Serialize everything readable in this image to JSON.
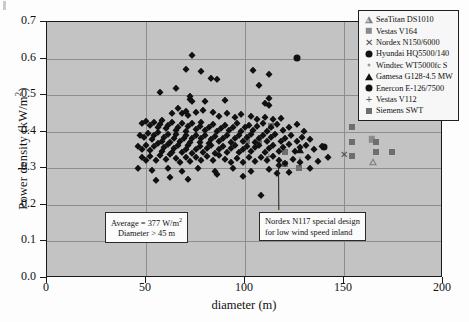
{
  "chart_data": {
    "type": "scatter",
    "title": "",
    "xlabel": "diameter (m)",
    "ylabel": "Power density (kW/m²)",
    "xlim": [
      0,
      200
    ],
    "ylim": [
      0.0,
      0.7
    ],
    "xticks": [
      0,
      50,
      100,
      150,
      200
    ],
    "yticks": [
      "0.0",
      "0.1",
      "0.2",
      "0.3",
      "0.4",
      "0.5",
      "0.6",
      "0.7"
    ],
    "grid": true,
    "legend_position": "top-right",
    "background_color": "#c3c3c3",
    "series": [
      {
        "name": "SeaTitan DS1010",
        "marker": "triangle-open",
        "color": "#7d7d7d",
        "points": [
          [
            165,
            0.318
          ]
        ]
      },
      {
        "name": "Vestas V164",
        "marker": "square-gray",
        "color": "#8a8a8a",
        "points": [
          [
            164,
            0.379
          ]
        ]
      },
      {
        "name": "Nordex N150/6000",
        "marker": "x",
        "color": "#4a4a4a",
        "points": [
          [
            150,
            0.34
          ]
        ]
      },
      {
        "name": "Hyundai HQ5500/140",
        "marker": "circle",
        "color": "#111111",
        "points": [
          [
            140,
            0.357
          ]
        ]
      },
      {
        "name": "Windtec WT5000fc S",
        "marker": "dot",
        "color": "#9b9b9b",
        "points": [
          [
            128,
            0.329
          ]
        ]
      },
      {
        "name": "Gamesa G128-4.5 MW",
        "marker": "triangle",
        "color": "#111111",
        "points": [
          [
            128,
            0.35
          ]
        ]
      },
      {
        "name": "Enercon E-126/7500",
        "marker": "circle",
        "color": "#111111",
        "points": [
          [
            126,
            0.601
          ]
        ]
      },
      {
        "name": "Vestas V112",
        "marker": "plus",
        "color": "#5a5a5a",
        "points": [
          [
            112,
            0.335
          ]
        ]
      },
      {
        "name": "Siemens SWT",
        "marker": "square-dark",
        "color": "#6e6e6e",
        "points": [
          [
            101,
            0.374
          ],
          [
            107,
            0.374
          ],
          [
            113,
            0.416
          ],
          [
            120,
            0.312
          ],
          [
            120,
            0.345
          ],
          [
            127,
            0.3
          ],
          [
            154,
            0.413
          ],
          [
            154,
            0.373
          ],
          [
            154,
            0.335
          ],
          [
            166,
            0.373
          ],
          [
            166,
            0.345
          ],
          [
            174,
            0.345
          ]
        ]
      },
      {
        "name": "Wind turbine fleet",
        "marker": "diamond",
        "color": "#111111",
        "points": [
          [
            73,
            0.611
          ],
          [
            70,
            0.572
          ],
          [
            78,
            0.567
          ],
          [
            65,
            0.52
          ],
          [
            83,
            0.546
          ],
          [
            86,
            0.544
          ],
          [
            104,
            0.568
          ],
          [
            112,
            0.558
          ],
          [
            107,
            0.529
          ],
          [
            57,
            0.509
          ],
          [
            72,
            0.497
          ],
          [
            72,
            0.49
          ],
          [
            73,
            0.484
          ],
          [
            80,
            0.484
          ],
          [
            90,
            0.487
          ],
          [
            112,
            0.493
          ],
          [
            112,
            0.473
          ],
          [
            110,
            0.479
          ],
          [
            63,
            0.452
          ],
          [
            66,
            0.466
          ],
          [
            68,
            0.452
          ],
          [
            70,
            0.458
          ],
          [
            71,
            0.446
          ],
          [
            75,
            0.455
          ],
          [
            79,
            0.46
          ],
          [
            84,
            0.454
          ],
          [
            87,
            0.443
          ],
          [
            91,
            0.45
          ],
          [
            95,
            0.441
          ],
          [
            98,
            0.448
          ],
          [
            103,
            0.444
          ],
          [
            106,
            0.436
          ],
          [
            110,
            0.44
          ],
          [
            114,
            0.434
          ],
          [
            118,
            0.438
          ],
          [
            48,
            0.424
          ],
          [
            50,
            0.43
          ],
          [
            52,
            0.418
          ],
          [
            54,
            0.428
          ],
          [
            56,
            0.414
          ],
          [
            57,
            0.422
          ],
          [
            58,
            0.432
          ],
          [
            60,
            0.41
          ],
          [
            61,
            0.419
          ],
          [
            63,
            0.426
          ],
          [
            65,
            0.404
          ],
          [
            66,
            0.413
          ],
          [
            68,
            0.423
          ],
          [
            70,
            0.402
          ],
          [
            71,
            0.415
          ],
          [
            73,
            0.425
          ],
          [
            75,
            0.408
          ],
          [
            77,
            0.417
          ],
          [
            78,
            0.427
          ],
          [
            80,
            0.406
          ],
          [
            82,
            0.413
          ],
          [
            84,
            0.421
          ],
          [
            86,
            0.401
          ],
          [
            88,
            0.411
          ],
          [
            90,
            0.418
          ],
          [
            92,
            0.405
          ],
          [
            94,
            0.414
          ],
          [
            96,
            0.423
          ],
          [
            98,
            0.402
          ],
          [
            100,
            0.412
          ],
          [
            102,
            0.419
          ],
          [
            104,
            0.406
          ],
          [
            106,
            0.415
          ],
          [
            109,
            0.424
          ],
          [
            111,
            0.403
          ],
          [
            113,
            0.412
          ],
          [
            116,
            0.421
          ],
          [
            119,
            0.404
          ],
          [
            122,
            0.414
          ],
          [
            126,
            0.42
          ],
          [
            130,
            0.402
          ],
          [
            47,
            0.392
          ],
          [
            49,
            0.386
          ],
          [
            51,
            0.396
          ],
          [
            53,
            0.38
          ],
          [
            54,
            0.39
          ],
          [
            56,
            0.398
          ],
          [
            58,
            0.376
          ],
          [
            59,
            0.386
          ],
          [
            61,
            0.394
          ],
          [
            62,
            0.372
          ],
          [
            64,
            0.383
          ],
          [
            65,
            0.393
          ],
          [
            67,
            0.374
          ],
          [
            69,
            0.384
          ],
          [
            70,
            0.392
          ],
          [
            72,
            0.371
          ],
          [
            73,
            0.382
          ],
          [
            75,
            0.391
          ],
          [
            77,
            0.373
          ],
          [
            78,
            0.383
          ],
          [
            80,
            0.39
          ],
          [
            82,
            0.37
          ],
          [
            83,
            0.381
          ],
          [
            85,
            0.389
          ],
          [
            87,
            0.374
          ],
          [
            89,
            0.384
          ],
          [
            91,
            0.392
          ],
          [
            93,
            0.372
          ],
          [
            95,
            0.382
          ],
          [
            97,
            0.39
          ],
          [
            99,
            0.375
          ],
          [
            101,
            0.385
          ],
          [
            103,
            0.393
          ],
          [
            105,
            0.373
          ],
          [
            107,
            0.383
          ],
          [
            109,
            0.391
          ],
          [
            111,
            0.376
          ],
          [
            113,
            0.386
          ],
          [
            115,
            0.394
          ],
          [
            118,
            0.374
          ],
          [
            120,
            0.384
          ],
          [
            123,
            0.39
          ],
          [
            126,
            0.376
          ],
          [
            129,
            0.386
          ],
          [
            133,
            0.38
          ],
          [
            46,
            0.362
          ],
          [
            48,
            0.354
          ],
          [
            50,
            0.364
          ],
          [
            52,
            0.35
          ],
          [
            54,
            0.36
          ],
          [
            56,
            0.368
          ],
          [
            58,
            0.348
          ],
          [
            59,
            0.358
          ],
          [
            61,
            0.366
          ],
          [
            63,
            0.346
          ],
          [
            64,
            0.356
          ],
          [
            66,
            0.364
          ],
          [
            68,
            0.344
          ],
          [
            70,
            0.354
          ],
          [
            71,
            0.363
          ],
          [
            73,
            0.343
          ],
          [
            75,
            0.353
          ],
          [
            77,
            0.362
          ],
          [
            79,
            0.345
          ],
          [
            81,
            0.355
          ],
          [
            83,
            0.364
          ],
          [
            85,
            0.343
          ],
          [
            87,
            0.353
          ],
          [
            89,
            0.361
          ],
          [
            91,
            0.346
          ],
          [
            93,
            0.356
          ],
          [
            95,
            0.364
          ],
          [
            97,
            0.344
          ],
          [
            99,
            0.354
          ],
          [
            101,
            0.362
          ],
          [
            103,
            0.347
          ],
          [
            105,
            0.357
          ],
          [
            107,
            0.365
          ],
          [
            110,
            0.345
          ],
          [
            112,
            0.355
          ],
          [
            114,
            0.363
          ],
          [
            117,
            0.348
          ],
          [
            119,
            0.358
          ],
          [
            122,
            0.366
          ],
          [
            125,
            0.347
          ],
          [
            128,
            0.357
          ],
          [
            131,
            0.364
          ],
          [
            135,
            0.352
          ],
          [
            139,
            0.36
          ],
          [
            48,
            0.332
          ],
          [
            50,
            0.322
          ],
          [
            52,
            0.334
          ],
          [
            55,
            0.324
          ],
          [
            57,
            0.336
          ],
          [
            60,
            0.326
          ],
          [
            62,
            0.338
          ],
          [
            65,
            0.328
          ],
          [
            67,
            0.318
          ],
          [
            70,
            0.33
          ],
          [
            72,
            0.32
          ],
          [
            75,
            0.332
          ],
          [
            78,
            0.322
          ],
          [
            81,
            0.334
          ],
          [
            84,
            0.324
          ],
          [
            87,
            0.336
          ],
          [
            90,
            0.326
          ],
          [
            93,
            0.316
          ],
          [
            96,
            0.328
          ],
          [
            99,
            0.318
          ],
          [
            102,
            0.33
          ],
          [
            105,
            0.32
          ],
          [
            108,
            0.332
          ],
          [
            111,
            0.322
          ],
          [
            114,
            0.334
          ],
          [
            117,
            0.324
          ],
          [
            120,
            0.314
          ],
          [
            124,
            0.326
          ],
          [
            128,
            0.318
          ],
          [
            132,
            0.33
          ],
          [
            137,
            0.32
          ],
          [
            142,
            0.332
          ],
          [
            46,
            0.3
          ],
          [
            53,
            0.296
          ],
          [
            61,
            0.302
          ],
          [
            68,
            0.292
          ],
          [
            76,
            0.3
          ],
          [
            85,
            0.294
          ],
          [
            94,
            0.302
          ],
          [
            103,
            0.292
          ],
          [
            112,
            0.298
          ],
          [
            122,
            0.29
          ],
          [
            133,
            0.3
          ],
          [
            86,
            0.284
          ],
          [
            99,
            0.28
          ],
          [
            116,
            0.286
          ],
          [
            117,
            0.31
          ],
          [
            108,
            0.228
          ],
          [
            71,
            0.27
          ],
          [
            62,
            0.276
          ],
          [
            55,
            0.268
          ]
        ]
      }
    ],
    "annotations": [
      {
        "id": "average",
        "line1": "Average = 377 W/m²",
        "line2": "Diameter > 45 m"
      },
      {
        "id": "nordex",
        "line1": "Nordex N117 special design",
        "line2": "for low wind speed inland"
      }
    ]
  },
  "legend": {
    "items": [
      {
        "label": "SeaTitan DS1010",
        "marker": "triangle-open"
      },
      {
        "label": "Vestas V164",
        "marker": "square-gray"
      },
      {
        "label": "Nordex N150/6000",
        "marker": "x"
      },
      {
        "label": "Hyundai HQ5500/140",
        "marker": "circle"
      },
      {
        "label": "Windtec WT5000fc S",
        "marker": "dot"
      },
      {
        "label": "Gamesa G128-4.5 MW",
        "marker": "triangle"
      },
      {
        "label": "Enercon E-126/7500",
        "marker": "circle"
      },
      {
        "label": "Vestas V112",
        "marker": "plus"
      },
      {
        "label": "Siemens SWT",
        "marker": "square-dark"
      }
    ]
  }
}
